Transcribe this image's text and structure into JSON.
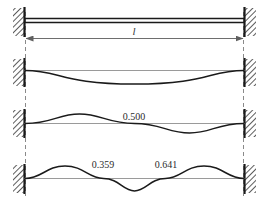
{
  "figure": {
    "span_label": "l",
    "colors": {
      "beam": "#1a1a1a",
      "curve": "#1a1a1a",
      "reference_line": "#9a9a9a",
      "dimension_line": "#6e6e6e",
      "dashed_extension": "#8a8a8a",
      "support_hatch": "#333333",
      "text": "#2b2b2b",
      "background": "#ffffff"
    },
    "supports": {
      "left_type": "fixed-wall",
      "right_type": "fixed-wall",
      "count": 4
    },
    "dimension": {
      "label": "l",
      "arrow_left": "arrow-left",
      "arrow_right": "arrow-right"
    },
    "rows": [
      {
        "name": "span-row",
        "kind": "undeformed",
        "node_labels": []
      },
      {
        "name": "mode-1-row",
        "kind": "mode-shape",
        "half_waves": 1,
        "node_labels": []
      },
      {
        "name": "mode-2-row",
        "kind": "mode-shape",
        "half_waves": 2,
        "node_labels": [
          "0.500"
        ]
      },
      {
        "name": "mode-3-row",
        "kind": "mode-shape",
        "half_waves": 3,
        "node_labels": [
          "0.359",
          "0.641"
        ]
      }
    ],
    "annotations": {
      "mode2_node": "0.500",
      "mode3_node_left": "0.359",
      "mode3_node_right": "0.641"
    }
  }
}
